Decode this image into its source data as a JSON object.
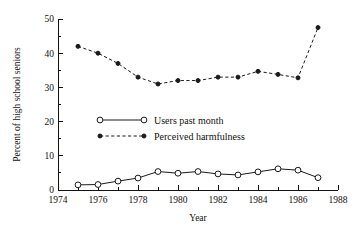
{
  "chart_data": {
    "type": "line",
    "title": "",
    "subtitle": "",
    "xlabel": "Year",
    "ylabel": "Percent of high school seniors",
    "xlim": [
      1974,
      1988
    ],
    "ylim": [
      0,
      50
    ],
    "grid": false,
    "legend_position": "center-left",
    "x_ticks_major": [
      1974,
      1976,
      1978,
      1980,
      1982,
      1984,
      1986,
      1988
    ],
    "x_tick_labels": [
      "1974",
      "1976",
      "1978",
      "1980",
      "1982",
      "1984",
      "1986",
      "1988"
    ],
    "x_ticks_minor": [
      1975,
      1977,
      1979,
      1981,
      1983,
      1985,
      1987
    ],
    "y_ticks_major": [
      0,
      10,
      20,
      30,
      40,
      50
    ],
    "y_tick_labels": [
      "0",
      "10",
      "20",
      "30",
      "40",
      "50"
    ],
    "y_ticks_minor": [
      5,
      15,
      25,
      35,
      45
    ],
    "x": [
      1975,
      1976,
      1977,
      1978,
      1979,
      1980,
      1981,
      1982,
      1983,
      1984,
      1985,
      1986,
      1987
    ],
    "series": [
      {
        "name": "Users past month",
        "marker": "open-circle",
        "line": "solid",
        "values": [
          1.5,
          1.6,
          2.6,
          3.5,
          5.4,
          4.9,
          5.4,
          4.7,
          4.4,
          5.3,
          6.2,
          5.8,
          3.6
        ]
      },
      {
        "name": "Perceived harmfulness",
        "marker": "filled-circle",
        "line": "dashed",
        "values": [
          42.0,
          40.0,
          37.0,
          33.0,
          31.0,
          32.0,
          32.0,
          33.0,
          33.0,
          34.7,
          33.8,
          32.8,
          47.5
        ]
      }
    ],
    "colors": {
      "axis": "#111111",
      "series_1": "#1a1a1a",
      "series_2": "#1a1a1a",
      "background": "#ffffff"
    }
  },
  "legend": {
    "items": [
      {
        "label": "Users past month"
      },
      {
        "label": "Perceived harmfulness"
      }
    ]
  }
}
